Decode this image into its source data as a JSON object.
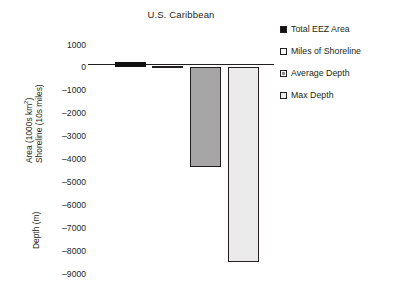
{
  "chart_data": {
    "type": "bar",
    "title": "U.S. Caribbean",
    "xlabel": "",
    "ylabel": "Area (1000s km2) Shoreline (10s miles) / Depth (m)",
    "ylim": [
      -9000,
      1000
    ],
    "grid": false,
    "legend_position": "right",
    "categories": [
      "Total EEZ Area",
      "Miles of Shoreline",
      "Average Depth",
      "Max Depth"
    ],
    "values": [
      250,
      80,
      -4340,
      -8470
    ],
    "series": [
      {
        "name": "Total EEZ Area",
        "value": 250,
        "color": "#111111",
        "border": "#111111"
      },
      {
        "name": "Miles of Shoreline",
        "value": 80,
        "color": "#ffffff",
        "border": "#231f20"
      },
      {
        "name": "Average Depth",
        "value": -4340,
        "color": "#a6a6a6",
        "border": "#231f20"
      },
      {
        "name": "Max Depth",
        "value": -8470,
        "color": "#ebebeb",
        "border": "#231f20"
      }
    ],
    "yticks": [
      1000,
      0,
      -1000,
      -2000,
      -3000,
      -4000,
      -5000,
      -6000,
      -7000,
      -8000,
      -9000
    ],
    "ytick_labels": [
      "1000",
      "0",
      "–1000",
      "–2000",
      "–3000",
      "–4000",
      "–5000",
      "–6000",
      "–7000",
      "–8000",
      "–9000"
    ]
  },
  "title": "U.S. Caribbean",
  "axis_titles": {
    "area_line1": "Area (1000s km",
    "area_sup": "2",
    "area_line1_end": ")",
    "area_line2": "Shoreline (10s miles)",
    "depth": "Depth (m)"
  },
  "legend": {
    "items": [
      {
        "label": "Total EEZ Area"
      },
      {
        "label": "Miles of Shoreline"
      },
      {
        "label": "Average Depth"
      },
      {
        "label": "Max Depth"
      }
    ]
  }
}
